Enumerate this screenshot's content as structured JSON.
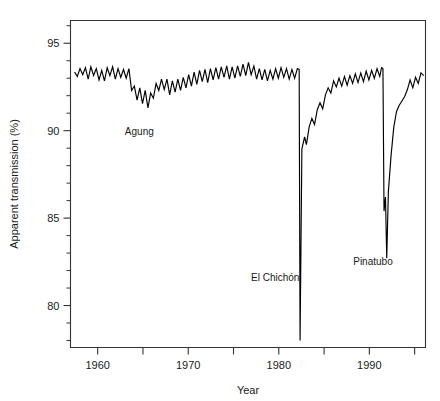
{
  "chart_data": {
    "type": "line",
    "title": "",
    "xlabel": "Year",
    "ylabel": "Apparent transmission (%)",
    "xlim": [
      1957.0,
      1996.2
    ],
    "ylim": [
      77.6,
      96.3
    ],
    "grid": false,
    "legend": null,
    "x_major_ticks": [
      1960,
      1970,
      1980,
      1990
    ],
    "x_major_tick_labels": [
      "1960",
      "1970",
      "1980",
      "1990"
    ],
    "x_minor_ticks": [
      1965,
      1975,
      1985,
      1995
    ],
    "y_major_ticks": [
      80,
      85,
      90,
      95
    ],
    "y_major_tick_labels": [
      "80",
      "85",
      "90",
      "95"
    ],
    "y_minor_ticks": [
      78,
      79,
      81,
      82,
      83,
      84,
      86,
      87,
      88,
      89,
      91,
      92,
      93,
      94,
      96
    ],
    "annotations": [
      {
        "label": "Agung",
        "x": 1964.6,
        "y": 89.75
      },
      {
        "label": "El Chichón",
        "x": 1979.6,
        "y": 81.4
      },
      {
        "label": "Pinatubo",
        "x": 1990.4,
        "y": 82.3
      }
    ],
    "series": [
      {
        "name": "Apparent transmission",
        "color": "#000000",
        "points": [
          [
            1957.45,
            93.35
          ],
          [
            1957.75,
            93.1
          ],
          [
            1958.05,
            93.55
          ],
          [
            1958.35,
            93.2
          ],
          [
            1958.65,
            93.6
          ],
          [
            1958.95,
            92.95
          ],
          [
            1959.25,
            93.65
          ],
          [
            1959.55,
            93.15
          ],
          [
            1959.85,
            93.55
          ],
          [
            1960.15,
            92.9
          ],
          [
            1960.45,
            93.45
          ],
          [
            1960.75,
            92.85
          ],
          [
            1961.05,
            93.6
          ],
          [
            1961.35,
            93.15
          ],
          [
            1961.65,
            93.65
          ],
          [
            1961.95,
            92.95
          ],
          [
            1962.25,
            93.55
          ],
          [
            1962.55,
            93.05
          ],
          [
            1962.85,
            93.5
          ],
          [
            1963.15,
            93.0
          ],
          [
            1963.45,
            93.55
          ],
          [
            1963.75,
            92.3
          ],
          [
            1964.05,
            92.55
          ],
          [
            1964.35,
            91.75
          ],
          [
            1964.65,
            92.45
          ],
          [
            1964.95,
            91.55
          ],
          [
            1965.25,
            92.3
          ],
          [
            1965.55,
            91.3
          ],
          [
            1965.85,
            92.15
          ],
          [
            1966.15,
            91.85
          ],
          [
            1966.45,
            92.7
          ],
          [
            1966.75,
            92.3
          ],
          [
            1967.05,
            92.95
          ],
          [
            1967.35,
            92.35
          ],
          [
            1967.65,
            92.95
          ],
          [
            1967.95,
            92.05
          ],
          [
            1968.25,
            92.85
          ],
          [
            1968.55,
            92.2
          ],
          [
            1968.85,
            92.95
          ],
          [
            1969.15,
            92.3
          ],
          [
            1969.45,
            93.05
          ],
          [
            1969.75,
            92.45
          ],
          [
            1970.05,
            93.2
          ],
          [
            1970.35,
            92.55
          ],
          [
            1970.65,
            93.35
          ],
          [
            1970.95,
            92.65
          ],
          [
            1971.25,
            93.45
          ],
          [
            1971.55,
            92.8
          ],
          [
            1971.85,
            93.5
          ],
          [
            1972.15,
            92.75
          ],
          [
            1972.45,
            93.55
          ],
          [
            1972.75,
            92.9
          ],
          [
            1973.05,
            93.6
          ],
          [
            1973.35,
            92.95
          ],
          [
            1973.65,
            93.65
          ],
          [
            1973.95,
            93.05
          ],
          [
            1974.25,
            93.7
          ],
          [
            1974.55,
            92.95
          ],
          [
            1974.85,
            93.65
          ],
          [
            1975.15,
            93.0
          ],
          [
            1975.45,
            93.7
          ],
          [
            1975.75,
            93.1
          ],
          [
            1976.05,
            93.8
          ],
          [
            1976.35,
            93.15
          ],
          [
            1976.65,
            93.9
          ],
          [
            1976.95,
            93.2
          ],
          [
            1977.25,
            93.7
          ],
          [
            1977.55,
            92.95
          ],
          [
            1977.85,
            93.55
          ],
          [
            1978.15,
            92.9
          ],
          [
            1978.45,
            93.5
          ],
          [
            1978.75,
            92.85
          ],
          [
            1979.05,
            93.45
          ],
          [
            1979.35,
            92.95
          ],
          [
            1979.65,
            93.55
          ],
          [
            1979.95,
            93.0
          ],
          [
            1980.25,
            93.6
          ],
          [
            1980.55,
            93.05
          ],
          [
            1980.85,
            93.55
          ],
          [
            1981.15,
            92.95
          ],
          [
            1981.45,
            93.5
          ],
          [
            1981.75,
            93.0
          ],
          [
            1982.05,
            93.55
          ],
          [
            1982.25,
            93.5
          ],
          [
            1982.35,
            78.0
          ],
          [
            1982.55,
            88.95
          ],
          [
            1982.85,
            89.65
          ],
          [
            1983.05,
            89.2
          ],
          [
            1983.35,
            90.2
          ],
          [
            1983.65,
            90.7
          ],
          [
            1983.95,
            90.35
          ],
          [
            1984.25,
            91.2
          ],
          [
            1984.55,
            91.6
          ],
          [
            1984.85,
            91.25
          ],
          [
            1985.15,
            92.05
          ],
          [
            1985.45,
            92.45
          ],
          [
            1985.75,
            92.15
          ],
          [
            1986.05,
            92.85
          ],
          [
            1986.35,
            92.5
          ],
          [
            1986.65,
            93.0
          ],
          [
            1986.95,
            92.55
          ],
          [
            1987.25,
            93.1
          ],
          [
            1987.55,
            92.6
          ],
          [
            1987.85,
            93.15
          ],
          [
            1988.15,
            92.7
          ],
          [
            1988.45,
            93.25
          ],
          [
            1988.75,
            92.75
          ],
          [
            1989.05,
            93.3
          ],
          [
            1989.35,
            92.8
          ],
          [
            1989.65,
            93.4
          ],
          [
            1989.95,
            92.9
          ],
          [
            1990.25,
            93.45
          ],
          [
            1990.55,
            93.0
          ],
          [
            1990.85,
            93.55
          ],
          [
            1991.15,
            93.1
          ],
          [
            1991.35,
            93.6
          ],
          [
            1991.5,
            93.55
          ],
          [
            1991.62,
            85.4
          ],
          [
            1991.78,
            86.2
          ],
          [
            1991.92,
            82.7
          ],
          [
            1992.1,
            86.5
          ],
          [
            1992.4,
            88.6
          ],
          [
            1992.7,
            90.2
          ],
          [
            1993.0,
            91.1
          ],
          [
            1993.3,
            91.45
          ],
          [
            1993.6,
            91.7
          ],
          [
            1993.9,
            91.95
          ],
          [
            1994.2,
            92.35
          ],
          [
            1994.5,
            92.9
          ],
          [
            1994.8,
            92.45
          ],
          [
            1995.1,
            93.05
          ],
          [
            1995.4,
            92.7
          ],
          [
            1995.7,
            93.3
          ],
          [
            1996.0,
            93.15
          ]
        ]
      }
    ]
  }
}
